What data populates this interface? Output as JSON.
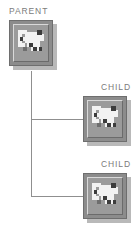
{
  "diagram": {
    "background_color": "#ffffff",
    "line_color": "#8f8f8f",
    "label_color": "#7b7b7b",
    "icon_frame_color": "#8c8c8c",
    "icon_face_color": "#9b9b9b",
    "icon_shadow_color": "#b9b9b9",
    "icon_glyph_light": "#f2f2f2",
    "icon_glyph_dark": "#3c3c3c",
    "nodes": [
      {
        "id": "parent",
        "label": "PARENT",
        "icon": "network-node-icon",
        "role": "root"
      },
      {
        "id": "child-1",
        "label": "CHILD",
        "icon": "network-node-icon",
        "role": "leaf"
      },
      {
        "id": "child-2",
        "label": "CHILD",
        "icon": "network-node-icon",
        "role": "leaf"
      }
    ],
    "connections": [
      {
        "from": "parent",
        "to": "child-1"
      },
      {
        "from": "parent",
        "to": "child-2"
      }
    ]
  }
}
